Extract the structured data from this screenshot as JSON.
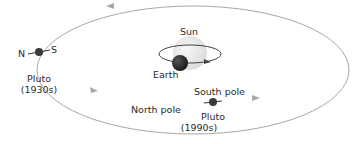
{
  "diagram": {
    "labels": {
      "sun": "Sun",
      "earth": "Earth",
      "pluto_1930s_name": "Pluto",
      "pluto_1930s_year": "(1930s)",
      "pluto_1990s_name": "Pluto",
      "pluto_1990s_year": "(1990s)",
      "north": "N",
      "south": "S",
      "north_pole": "North pole",
      "south_pole": "South pole"
    },
    "colors": {
      "orbit": "#a8a8a8",
      "sun": "#ececec",
      "earth": "#2e2e2e",
      "pluto": "#3a3a3a",
      "text": "#2a2a2a"
    }
  }
}
